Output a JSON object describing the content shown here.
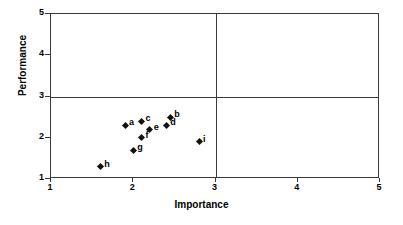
{
  "chart_data": {
    "type": "scatter",
    "title": "",
    "xlabel": "Importance",
    "ylabel": "Performance",
    "xlim": [
      1,
      5
    ],
    "ylim": [
      1,
      5
    ],
    "xticks": [
      "1",
      "2",
      "3",
      "4",
      "5"
    ],
    "yticks": [
      "1",
      "2",
      "3",
      "4",
      "5"
    ],
    "grid": false,
    "legend": "none",
    "reference_lines": [
      {
        "axis": "y",
        "value": 3
      },
      {
        "axis": "x",
        "value": 3
      }
    ],
    "marker_color": "#111111",
    "axis_color": "#3a3a3a",
    "points": [
      {
        "label": "a",
        "x": 1.9,
        "y": 2.3
      },
      {
        "label": "b",
        "x": 2.45,
        "y": 2.5
      },
      {
        "label": "c",
        "x": 2.1,
        "y": 2.4
      },
      {
        "label": "d",
        "x": 2.4,
        "y": 2.3
      },
      {
        "label": "e",
        "x": 2.2,
        "y": 2.2
      },
      {
        "label": "f",
        "x": 2.1,
        "y": 2.0
      },
      {
        "label": "g",
        "x": 2.0,
        "y": 1.7
      },
      {
        "label": "h",
        "x": 1.6,
        "y": 1.3
      },
      {
        "label": "i",
        "x": 2.8,
        "y": 1.9
      }
    ]
  }
}
